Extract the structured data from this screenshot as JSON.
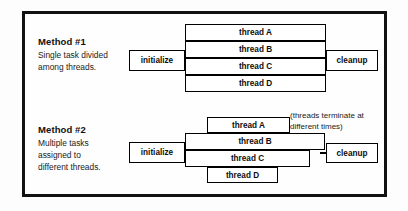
{
  "diagram": {
    "title_method1": "Method #1",
    "desc_method1_line1": "Single task divided",
    "desc_method1_line2": "among threads.",
    "title_method2": "Method #2",
    "desc_method2_line1": "Multiple tasks",
    "desc_method2_line2": "assigned to",
    "desc_method2_line3": "different threads.",
    "annotation_line1": "(threads terminate at",
    "annotation_line2": "different times)",
    "border_color": "#111111",
    "box_border_color": "#000000",
    "background_color": "#fdfdfd"
  },
  "method1": {
    "initialize": "initialize",
    "cleanup": "cleanup",
    "threads": [
      {
        "label": "thread A"
      },
      {
        "label": "thread B"
      },
      {
        "label": "thread C"
      },
      {
        "label": "thread D"
      }
    ]
  },
  "method2": {
    "initialize": "initialize",
    "cleanup": "cleanup",
    "threads": [
      {
        "label": "thread A"
      },
      {
        "label": "thread B"
      },
      {
        "label": "thread C"
      },
      {
        "label": "thread D"
      }
    ]
  }
}
